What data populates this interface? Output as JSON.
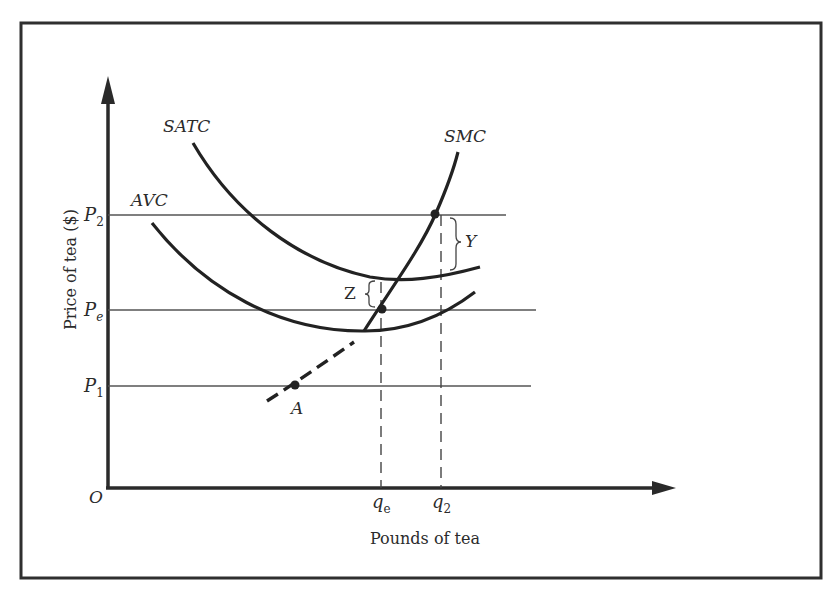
{
  "figure": {
    "frame": {
      "stroke": "#2f2f2f"
    },
    "axes": {
      "y_label": "Price of tea ($)",
      "x_label": "Pounds of tea",
      "origin_label": "O"
    },
    "price_levels": [
      {
        "name": "P2",
        "base": "P",
        "sub": "2"
      },
      {
        "name": "Pe",
        "base": "P",
        "sub": "e"
      },
      {
        "name": "P1",
        "base": "P",
        "sub": "1"
      }
    ],
    "quantity_levels": [
      {
        "name": "qe",
        "base": "q",
        "sub": "e"
      },
      {
        "name": "q2",
        "base": "q",
        "sub": "2"
      }
    ],
    "curves": {
      "satc": "SATC",
      "avc": "AVC",
      "smc": "SMC"
    },
    "annotations": {
      "point_a": "A",
      "gap_y": "Y",
      "gap_z": "Z"
    }
  }
}
